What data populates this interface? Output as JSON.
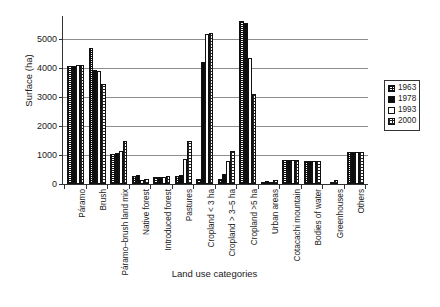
{
  "chart_data": {
    "type": "bar",
    "title": "",
    "xlabel": "Land use categories",
    "ylabel": "Surface (ha)",
    "ylim": [
      0,
      5800
    ],
    "yticks": [
      0,
      1000,
      2000,
      3000,
      4000,
      5000
    ],
    "ytick_labels": [
      "0",
      "1000",
      "2000",
      "3000",
      "4000",
      "5000"
    ],
    "grid": true,
    "legend_position": "right",
    "categories": [
      "Páramo",
      "Brush",
      "Páramo–brush land mix",
      "Native forest",
      "Introduced forest",
      "Pastures",
      "Cropland < 3 ha",
      "Cropland > 3–5 ha",
      "Cropland >5 ha",
      "Urban areas",
      "Cotacachi mountain",
      "Bodies of water",
      "Greenhouses",
      "Others"
    ],
    "series": [
      {
        "name": "1963",
        "values": [
          4080,
          4700,
          1050,
          290,
          250,
          290,
          180,
          190,
          5620,
          60,
          830,
          810,
          0,
          1120
        ]
      },
      {
        "name": "1978",
        "values": [
          4080,
          3950,
          1080,
          320,
          230,
          300,
          4200,
          330,
          5560,
          110,
          830,
          810,
          0,
          1120
        ]
      },
      {
        "name": "1993",
        "values": [
          4100,
          3900,
          1150,
          150,
          255,
          870,
          5180,
          790,
          4350,
          60,
          830,
          810,
          60,
          1120
        ]
      },
      {
        "name": "2000",
        "values": [
          4100,
          3450,
          1500,
          160,
          270,
          1470,
          5200,
          1130,
          3120,
          130,
          830,
          810,
          130,
          1120
        ]
      }
    ]
  },
  "legend": {
    "entries": [
      {
        "label": "1963",
        "pattern": "hatch-dark"
      },
      {
        "label": "1978",
        "pattern": "solid-black"
      },
      {
        "label": "1993",
        "pattern": "white"
      },
      {
        "label": "2000",
        "pattern": "grid-dots"
      }
    ]
  },
  "colors": {
    "axis": "#333333",
    "gridline": "#8d8d8d",
    "bar_outline": "#111111",
    "background": "#ffffff"
  }
}
